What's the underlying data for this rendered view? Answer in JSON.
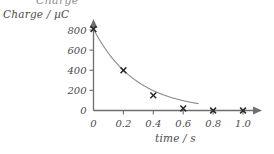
{
  "figure": {
    "clipped_top_text": "Charge",
    "y_axis_title": "Charge / µC",
    "x_axis_title": "time / s"
  },
  "chart_data": {
    "type": "line",
    "title": "",
    "subtitle": "",
    "xlabel": "time / s",
    "ylabel": "Charge / µC",
    "xlim": [
      0,
      1.08
    ],
    "ylim": [
      0,
      860
    ],
    "grid": false,
    "legend": null,
    "marker": "x",
    "curve_model": "exponential decay",
    "x_ticks": [
      0,
      0.2,
      0.4,
      0.6,
      0.8,
      1.0
    ],
    "x_tick_labels": [
      "0",
      "0.2",
      "0.4",
      "0.6",
      "0.8",
      "1.0"
    ],
    "y_ticks": [
      0,
      200,
      400,
      600,
      800
    ],
    "y_tick_labels": [
      "0",
      "200",
      "400",
      "600",
      "800"
    ],
    "series": [
      {
        "name": "charge",
        "x": [
          0,
          0.2,
          0.4,
          0.6,
          0.8,
          1.0
        ],
        "values": [
          810,
          400,
          150,
          20,
          0,
          0
        ]
      }
    ]
  },
  "style": {
    "axis_color": "#6e6e6e",
    "curve_color": "#8a8a8a",
    "marker_color": "#2a2a2a",
    "text_color": "#4a4a4a",
    "background": "#ffffff"
  }
}
